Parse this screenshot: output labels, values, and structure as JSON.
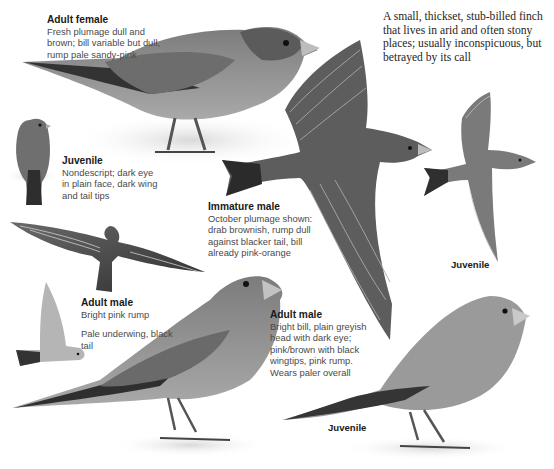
{
  "intro": {
    "text": "A small, thickset, stub-billed finch that lives in arid and often stony places; usually inconspicuous, but betrayed by its call"
  },
  "captions": {
    "adult_female": {
      "title": "Adult female",
      "body": "Fresh plumage dull and brown; bill variable but dull, rump pale sandy-pink"
    },
    "juvenile_perched_small": {
      "title": "Juvenile",
      "body": "Nondescript; dark eye in plain face, dark wing and tail tips"
    },
    "immature_male": {
      "title": "Immature male",
      "body": "October plumage shown: drab brownish, rump dull against blacker tail, bill already pink-orange"
    },
    "adult_male_flight": {
      "title": "Adult male",
      "body": "Bright pink rump",
      "body2": "Pale underwing, black tail"
    },
    "adult_male_perched": {
      "title": "Adult male",
      "body": "Bright bill, plain greyish head with dark eye; pink/brown with black wingtips, pink rump. Wears paler overall"
    }
  },
  "labels": {
    "juvenile_flight": "Juvenile",
    "juvenile_perched_large": "Juvenile"
  },
  "colors": {
    "background": "#ffffff",
    "plumage_mid": "#8a8a8a",
    "plumage_dark": "#3c3c3c",
    "plumage_light": "#b9b9b9",
    "text_dark": "#1a1a1a",
    "text_body": "#4a4a4a"
  }
}
